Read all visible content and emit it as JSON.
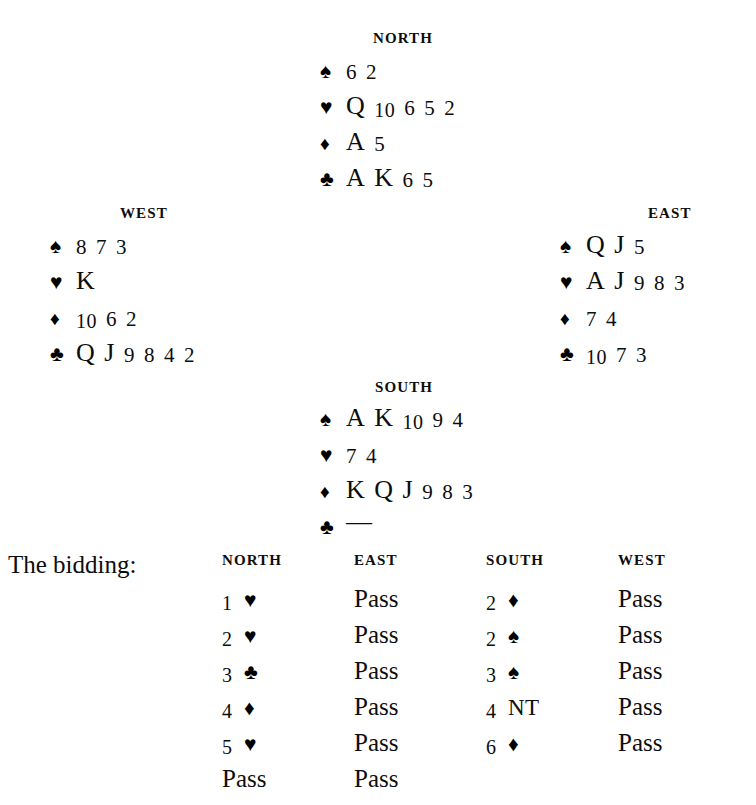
{
  "page": {
    "background_color": "#ffffff",
    "ink_color": "#0d0d0d"
  },
  "suit_glyphs": {
    "spade": "♠",
    "heart": "♥",
    "diamond": "♦",
    "club": "♣",
    "void": "—"
  },
  "hands": {
    "north": {
      "label": "NORTH",
      "suits": [
        {
          "suit": "spade",
          "glyph": "♠",
          "ranks": [
            "6",
            "2"
          ]
        },
        {
          "suit": "heart",
          "glyph": "♥",
          "ranks": [
            "Q",
            "10",
            "6",
            "5",
            "2"
          ]
        },
        {
          "suit": "diamond",
          "glyph": "♦",
          "ranks": [
            "A",
            "5"
          ]
        },
        {
          "suit": "club",
          "glyph": "♣",
          "ranks": [
            "A",
            "K",
            "6",
            "5"
          ]
        }
      ]
    },
    "west": {
      "label": "WEST",
      "suits": [
        {
          "suit": "spade",
          "glyph": "♠",
          "ranks": [
            "8",
            "7",
            "3"
          ]
        },
        {
          "suit": "heart",
          "glyph": "♥",
          "ranks": [
            "K"
          ]
        },
        {
          "suit": "diamond",
          "glyph": "♦",
          "ranks": [
            "10",
            "6",
            "2"
          ]
        },
        {
          "suit": "club",
          "glyph": "♣",
          "ranks": [
            "Q",
            "J",
            "9",
            "8",
            "4",
            "2"
          ]
        }
      ]
    },
    "east": {
      "label": "EAST",
      "suits": [
        {
          "suit": "spade",
          "glyph": "♠",
          "ranks": [
            "Q",
            "J",
            "5"
          ]
        },
        {
          "suit": "heart",
          "glyph": "♥",
          "ranks": [
            "A",
            "J",
            "9",
            "8",
            "3"
          ]
        },
        {
          "suit": "diamond",
          "glyph": "♦",
          "ranks": [
            "7",
            "4"
          ]
        },
        {
          "suit": "club",
          "glyph": "♣",
          "ranks": [
            "10",
            "7",
            "3"
          ]
        }
      ]
    },
    "south": {
      "label": "SOUTH",
      "suits": [
        {
          "suit": "spade",
          "glyph": "♠",
          "ranks": [
            "A",
            "K",
            "10",
            "9",
            "4"
          ]
        },
        {
          "suit": "heart",
          "glyph": "♥",
          "ranks": [
            "7",
            "4"
          ]
        },
        {
          "suit": "diamond",
          "glyph": "♦",
          "ranks": [
            "K",
            "Q",
            "J",
            "9",
            "8",
            "3"
          ]
        },
        {
          "suit": "club",
          "glyph": "♣",
          "ranks": [
            "—"
          ]
        }
      ]
    }
  },
  "bidding": {
    "title": "The bidding:",
    "columns": [
      "NORTH",
      "EAST",
      "SOUTH",
      "WEST"
    ],
    "rows": [
      [
        {
          "type": "suit_bid",
          "level": "1",
          "suit": "heart",
          "glyph": "♥",
          "text": "1 ♥"
        },
        {
          "type": "pass",
          "text": "Pass"
        },
        {
          "type": "suit_bid",
          "level": "2",
          "suit": "diamond",
          "glyph": "♦",
          "text": "2 ♦"
        },
        {
          "type": "pass",
          "text": "Pass"
        }
      ],
      [
        {
          "type": "suit_bid",
          "level": "2",
          "suit": "heart",
          "glyph": "♥",
          "text": "2 ♥"
        },
        {
          "type": "pass",
          "text": "Pass"
        },
        {
          "type": "suit_bid",
          "level": "2",
          "suit": "spade",
          "glyph": "♠",
          "text": "2 ♠"
        },
        {
          "type": "pass",
          "text": "Pass"
        }
      ],
      [
        {
          "type": "suit_bid",
          "level": "3",
          "suit": "club",
          "glyph": "♣",
          "text": "3 ♣"
        },
        {
          "type": "pass",
          "text": "Pass"
        },
        {
          "type": "suit_bid",
          "level": "3",
          "suit": "spade",
          "glyph": "♠",
          "text": "3 ♠"
        },
        {
          "type": "pass",
          "text": "Pass"
        }
      ],
      [
        {
          "type": "suit_bid",
          "level": "4",
          "suit": "diamond",
          "glyph": "♦",
          "text": "4 ♦"
        },
        {
          "type": "pass",
          "text": "Pass"
        },
        {
          "type": "nt_bid",
          "level": "4",
          "denom": "NT",
          "text": "4 NT"
        },
        {
          "type": "pass",
          "text": "Pass"
        }
      ],
      [
        {
          "type": "suit_bid",
          "level": "5",
          "suit": "heart",
          "glyph": "♥",
          "text": "5 ♥"
        },
        {
          "type": "pass",
          "text": "Pass"
        },
        {
          "type": "suit_bid",
          "level": "6",
          "suit": "diamond",
          "glyph": "♦",
          "text": "6 ♦"
        },
        {
          "type": "pass",
          "text": "Pass"
        }
      ],
      [
        {
          "type": "pass",
          "text": "Pass"
        },
        {
          "type": "pass",
          "text": "Pass"
        },
        {
          "type": "empty",
          "text": ""
        },
        {
          "type": "empty",
          "text": ""
        }
      ]
    ]
  }
}
